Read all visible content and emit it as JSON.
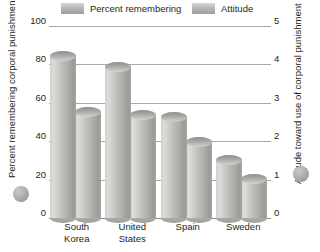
{
  "legend": {
    "items": [
      {
        "label": "Percent remembering",
        "swatch": "percent-swatch",
        "color": "#b7b7b4"
      },
      {
        "label": "Attitude",
        "swatch": "attitude-swatch",
        "color": "#b7b7b4"
      }
    ]
  },
  "axes": {
    "left": {
      "title": "Percent remembering corporal punishment as a child",
      "ticks": [
        "0",
        "20",
        "40",
        "60",
        "80",
        "100"
      ],
      "min": 0,
      "max": 100
    },
    "right": {
      "title": "Attitude toward use of corporal punishment",
      "ticks": [
        "0",
        "1",
        "2",
        "3",
        "4",
        "5"
      ],
      "min": 0,
      "max": 5
    }
  },
  "chart_data": {
    "type": "bar",
    "title": "",
    "xlabel": "",
    "ylabel": "Percent remembering corporal punishment as a child",
    "y2label": "Attitude toward use of corporal punishment",
    "categories": [
      "South Korea",
      "United States",
      "Spain",
      "Sweden"
    ],
    "series": [
      {
        "name": "Percent remembering",
        "axis": "left",
        "values": [
          87,
          81,
          55,
          33
        ],
        "color": "#b7b7b4"
      },
      {
        "name": "Attitude",
        "axis": "right",
        "values": [
          2.9,
          2.8,
          2.1,
          1.15
        ],
        "color": "#b7b7b4"
      }
    ],
    "ylim": [
      0,
      100
    ],
    "y2lim": [
      0,
      5
    ],
    "gridlines": [
      0,
      20,
      40,
      60,
      80,
      100
    ],
    "grid": true,
    "legend_position": "top"
  }
}
